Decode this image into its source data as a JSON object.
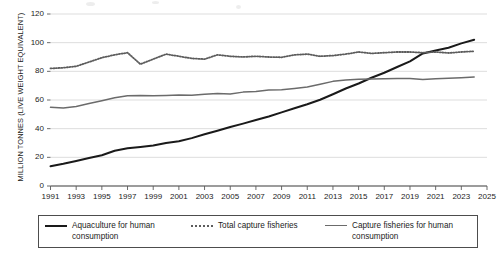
{
  "chart_data": {
    "type": "line",
    "title": "",
    "xlabel": "",
    "ylabel": "MILLION TONNES (LIVE WEIGHT EQUIVALENT)",
    "ylim": [
      0,
      120
    ],
    "xlim": [
      1991,
      2025
    ],
    "ytick_labels": [
      "0",
      "20",
      "40",
      "60",
      "80",
      "100",
      "120"
    ],
    "yticks": [
      0,
      20,
      40,
      60,
      80,
      100,
      120
    ],
    "xtick_labels": [
      "1991",
      "1993",
      "1995",
      "1997",
      "1999",
      "2001",
      "2003",
      "2005",
      "2007",
      "2009",
      "2011",
      "2013",
      "2015",
      "2017",
      "2019",
      "2021",
      "2023",
      "2025"
    ],
    "xticks": [
      1991,
      1993,
      1995,
      1997,
      1999,
      2001,
      2003,
      2005,
      2007,
      2009,
      2011,
      2013,
      2015,
      2017,
      2019,
      2021,
      2023,
      2025
    ],
    "grid": "horizontal",
    "legend_position": "bottom",
    "x": [
      1991,
      1992,
      1993,
      1994,
      1995,
      1996,
      1997,
      1998,
      1999,
      2000,
      2001,
      2002,
      2003,
      2004,
      2005,
      2006,
      2007,
      2008,
      2009,
      2010,
      2011,
      2012,
      2013,
      2014,
      2015,
      2016,
      2017,
      2018,
      2019,
      2020,
      2021,
      2022,
      2023,
      2024
    ],
    "series": [
      {
        "name": "Aquaculture for human consumption",
        "style": "solid",
        "color": "#1a1a1a",
        "width": 2.0,
        "values": [
          13.8,
          15.5,
          17.5,
          19.6,
          21.5,
          24.6,
          26.3,
          27.2,
          28.2,
          30.0,
          31.2,
          33.4,
          36.1,
          38.6,
          41.2,
          43.5,
          46.0,
          48.5,
          51.4,
          54.2,
          57.0,
          60.2,
          64.0,
          68.0,
          71.5,
          75.5,
          79.0,
          83.0,
          87.0,
          92.5,
          94.5,
          96.5,
          99.5,
          102.0
        ]
      },
      {
        "name": "Total capture fisheries",
        "style": "dotted",
        "color": "#5c5c5c",
        "width": 1.8,
        "values": [
          82.0,
          82.5,
          83.5,
          86.5,
          89.5,
          91.5,
          93.0,
          85.0,
          88.5,
          92.0,
          90.5,
          89.0,
          88.5,
          91.5,
          90.5,
          90.0,
          90.5,
          90.0,
          89.8,
          91.5,
          92.0,
          90.5,
          91.0,
          92.0,
          93.5,
          92.5,
          93.0,
          93.5,
          93.5,
          93.0,
          93.5,
          92.8,
          93.5,
          94.0
        ]
      },
      {
        "name": "Capture fisheries for human consumption",
        "style": "solid",
        "color": "#6b6b6b",
        "width": 1.5,
        "values": [
          55.0,
          54.5,
          55.5,
          57.5,
          59.5,
          61.5,
          63.0,
          63.2,
          63.0,
          63.2,
          63.5,
          63.3,
          64.0,
          64.5,
          64.2,
          65.5,
          66.0,
          67.0,
          67.2,
          68.0,
          69.0,
          71.0,
          73.0,
          74.0,
          74.5,
          74.6,
          74.8,
          75.0,
          75.0,
          74.3,
          74.8,
          75.2,
          75.6,
          76.0
        ]
      }
    ]
  },
  "legend": {
    "entries": [
      {
        "label": "Aquaculture for human consumption",
        "swatch": "solid-black-line-icon"
      },
      {
        "label": "Total capture fisheries",
        "swatch": "dotted-line-icon"
      },
      {
        "label": "Capture fisheries for human consumption",
        "swatch": "solid-gray-line-icon"
      }
    ]
  }
}
